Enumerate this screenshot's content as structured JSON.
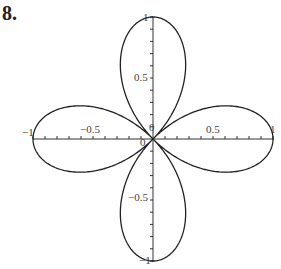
{
  "problem_label": "8.",
  "chart_data": {
    "type": "line",
    "title": "",
    "equation": "r = cos(2θ)",
    "xlabel": "",
    "ylabel": "",
    "xlim": [
      -1,
      1
    ],
    "ylim": [
      -1,
      1
    ],
    "grid": false,
    "legend": null,
    "x_ticks": [
      "-1",
      "-0.5",
      "0",
      "0.5",
      "1"
    ],
    "y_ticks": [
      "-1",
      "-0.5",
      "0",
      "0.5",
      "1"
    ],
    "series": [
      {
        "name": "r = cos(2θ)",
        "petal_tips": [
          [
            1,
            0
          ],
          [
            0,
            1
          ],
          [
            -1,
            0
          ],
          [
            0,
            -1
          ]
        ]
      }
    ]
  }
}
